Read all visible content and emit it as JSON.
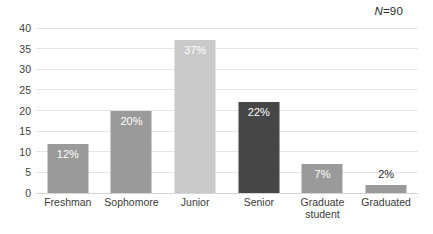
{
  "annotation": {
    "n_prefix": "N",
    "n_value": "=90"
  },
  "chart_data": {
    "type": "bar",
    "title": "",
    "subtitle": "",
    "xlabel": "",
    "ylabel": "",
    "ylim": [
      0,
      40
    ],
    "yticks": [
      0,
      5,
      10,
      15,
      20,
      25,
      30,
      35,
      40
    ],
    "ytick_labels": [
      "0",
      "5",
      "10",
      "15",
      "20",
      "25",
      "30",
      "35",
      "40"
    ],
    "grid": "horizontal",
    "legend": "none",
    "annotations": [
      "N=90"
    ],
    "categories": [
      "Freshman",
      "Sophomore",
      "Junior",
      "Senior",
      "Graduate student",
      "Graduated"
    ],
    "category_lines": [
      [
        "Freshman"
      ],
      [
        "Sophomore"
      ],
      [
        "Junior"
      ],
      [
        "Senior"
      ],
      [
        "Graduate",
        "student"
      ],
      [
        "Graduated"
      ]
    ],
    "values": [
      12,
      20,
      37,
      22,
      7,
      2
    ],
    "data_labels": [
      "12%",
      "20%",
      "37%",
      "22%",
      "7%",
      "2%"
    ],
    "label_placement": [
      "inside",
      "inside",
      "inside",
      "inside",
      "inside",
      "outside"
    ],
    "bar_colors": [
      "#9a9a9a",
      "#9a9a9a",
      "#c9c9c9",
      "#464646",
      "#9a9a9a",
      "#9a9a9a"
    ]
  },
  "colors": {
    "background": "#ffffff",
    "gridline": "#e4e4e4",
    "baseline": "#d4d4d4",
    "tick_text": "#404040",
    "category_text": "#3a3a3a",
    "label_inside": "#ffffff",
    "label_outside": "#2b2b2b"
  }
}
